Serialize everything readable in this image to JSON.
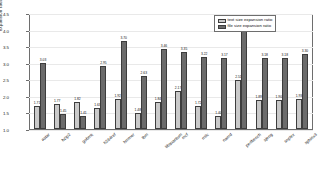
{
  "chart_data": {
    "type": "bar",
    "title": "",
    "xlabel": "",
    "ylabel": "expansion ratio",
    "ylim": [
      1.0,
      4.5
    ],
    "grid": true,
    "legend_position": "top-right",
    "y_ticks": [
      "4.5",
      "4.0",
      "3.5",
      "3.0",
      "2.5",
      "2.0",
      "1.5",
      "1.0"
    ],
    "categories": [
      "astar",
      "bzip2",
      "gobmk",
      "h264ref",
      "hmmer",
      "lbm",
      "libquantum",
      "mcf",
      "milc",
      "namd",
      "perlbench",
      "sjeng",
      "soplex",
      "sphinx3"
    ],
    "series": [
      {
        "name": "text size expansion ratio",
        "color": "#c9c9c9",
        "values": [
          1.71,
          1.77,
          1.82,
          1.63,
          1.92,
          1.48,
          1.84,
          2.17,
          1.72,
          1.4,
          2.51,
          1.89,
          1.9,
          1.93
        ]
      },
      {
        "name": "file size expansion ratio",
        "color": "#6b6b6b",
        "values": [
          3.03,
          1.45,
          1.41,
          2.95,
          3.7,
          2.63,
          3.46,
          3.35,
          3.22,
          3.17,
          4.22,
          3.18,
          3.18,
          3.3
        ]
      }
    ]
  },
  "legend": {
    "entries": [
      {
        "label": "text size expansion ratio"
      },
      {
        "label": "file size expansion ratio"
      }
    ]
  }
}
